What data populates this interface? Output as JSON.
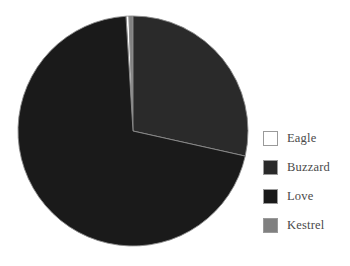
{
  "chart_data": {
    "type": "pie",
    "title": "",
    "categories": [
      "Eagle",
      "Buzzard",
      "Love",
      "Kestrel"
    ],
    "values": [
      1.5,
      28.5,
      68.0,
      2.0
    ],
    "unit": "percent",
    "legend_position": "right",
    "grid": false,
    "start_angle_deg": -90,
    "direction": "clockwise",
    "slices": [
      {
        "label": "Eagle",
        "value": 1.5,
        "color": "#ffffff",
        "edge_color": "#8c8c8c",
        "start_deg": 356.5,
        "end_deg": 358.0
      },
      {
        "label": "Kestrel",
        "value": 2.0,
        "color": "#808080",
        "edge_color": "#8c8c8c",
        "start_deg": 358.0,
        "end_deg": 360.0
      },
      {
        "label": "Buzzard",
        "value": 28.5,
        "color": "#2a2a2a",
        "edge_color": "#8c8c8c",
        "start_deg": 0.0,
        "end_deg": 102.6
      },
      {
        "label": "Love",
        "value": 68.0,
        "color": "#1a1a1a",
        "edge_color": "#8c8c8c",
        "start_deg": 102.6,
        "end_deg": 356.5
      }
    ],
    "geometry": {
      "center_x": 133,
      "center_y": 131,
      "radius": 115
    }
  },
  "legend": {
    "items": [
      {
        "label": "Eagle",
        "color": "#ffffff"
      },
      {
        "label": "Buzzard",
        "color": "#2a2a2a"
      },
      {
        "label": "Love",
        "color": "#1a1a1a"
      },
      {
        "label": "Kestrel",
        "color": "#808080"
      }
    ]
  },
  "colors": {
    "background": "#ffffff",
    "legend_text": "#4a4a4a",
    "swatch_border": "#9a9a9a",
    "slice_edge": "#8c8c8c"
  }
}
